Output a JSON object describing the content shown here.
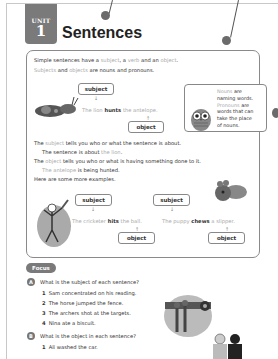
{
  "unit": {
    "label": "UNIT",
    "number": "1"
  },
  "title": "Sentences",
  "intro": {
    "line1": {
      "a": "Simple sentences have a ",
      "subject": "subject",
      "b": ", a ",
      "verb": "verb",
      "c": " and an ",
      "object": "object",
      "d": "."
    },
    "line2": {
      "subjects": "Subjects",
      "a": " and ",
      "objects": "objects",
      "b": " are nouns and pronouns."
    }
  },
  "example1": {
    "subject_label": "subject",
    "object_label": "object",
    "sentence": {
      "subject": "The lion",
      "verb": " hunts ",
      "object": "the antelope."
    }
  },
  "note": {
    "nouns": "Nouns",
    "line1_rest": " are",
    "line2": "naming words.",
    "pronouns": "Pronouns",
    "line3_rest": " are",
    "line4": "words that can",
    "line5": "take the place",
    "line6": "of nouns."
  },
  "explanations": {
    "subject_line": {
      "a": "The ",
      "subject": "subject",
      "b": " tells you who or what the sentence is about."
    },
    "subject_example": {
      "a": "The sentence is about ",
      "hl": "the lion",
      "b": "."
    },
    "object_line": {
      "a": "The ",
      "object": "object",
      "b": " tells you who or what is having something done to it."
    },
    "object_example": {
      "hl": "The antelope",
      "b": " is being hunted."
    },
    "more": "Here are some more examples."
  },
  "example2": {
    "subject_label": "subject",
    "object_label": "object",
    "sentence": {
      "subject": "The cricketer",
      "verb": " hits ",
      "object": "the ball."
    }
  },
  "example3": {
    "subject_label": "subject",
    "object_label": "object",
    "sentence": {
      "subject": "The puppy",
      "verb": " chews ",
      "object": "a slipper."
    }
  },
  "focus": {
    "badge": "Focus",
    "sectionA": {
      "letter": "A",
      "question": "What is the subject of each sentence?",
      "items": [
        {
          "num": "1",
          "text": "Sam concentrated on his reading."
        },
        {
          "num": "2",
          "text": "The horse jumped the fence."
        },
        {
          "num": "3",
          "text": "The archers shot at the targets."
        },
        {
          "num": "4",
          "text": "Nina ate a biscuit."
        }
      ]
    },
    "sectionB": {
      "letter": "B",
      "question": "What is the object in each sentence?",
      "items": [
        {
          "num": "1",
          "text": "Ali washed the car."
        }
      ]
    }
  },
  "colors": {
    "highlight": "#a8a8a8",
    "tab": "#7a7a7a",
    "border": "#8a8a8a"
  }
}
